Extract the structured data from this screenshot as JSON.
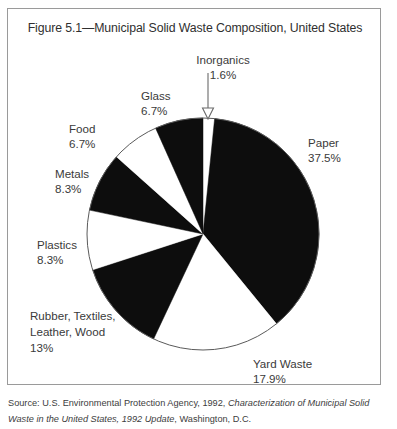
{
  "figure": {
    "title": "Figure 5.1—Municipal Solid Waste Composition, United States",
    "source_prefix": "Source: U.S. Environmental Protection Agency, 1992, ",
    "source_italic_1": "Characterization of Municipal Solid Waste in the United States, 1992 Update",
    "source_suffix": ", Washington, D.C."
  },
  "labels": {
    "inorganics_name": "Inorganics",
    "inorganics_pct": "1.6%",
    "glass_name": "Glass",
    "glass_pct": "6.7%",
    "paper_name": "Paper",
    "paper_pct": "37.5%",
    "food_name": "Food",
    "food_pct": "6.7%",
    "metals_name": "Metals",
    "metals_pct": "8.3%",
    "plastics_name": "Plastics",
    "plastics_pct": "8.3%",
    "rubber_line1": "Rubber, Textiles,",
    "rubber_line2": "Leather, Wood",
    "rubber_pct": "13%",
    "yardwaste_name": "Yard Waste",
    "yardwaste_pct": "17.9%"
  },
  "chart_data": {
    "type": "pie",
    "title": "Figure 5.1—Municipal Solid Waste Composition, United States",
    "xlabel": "",
    "ylabel": "",
    "legend": "none",
    "grid": false,
    "units": "percent of total municipal solid waste",
    "start_angle_deg": 0,
    "direction": "clockwise",
    "center": {
      "x": 202,
      "y": 233
    },
    "radius": 116,
    "categories": [
      "Inorganics",
      "Paper",
      "Yard Waste",
      "Rubber, Textiles, Leather, Wood",
      "Plastics",
      "Metals",
      "Food",
      "Glass"
    ],
    "values": [
      1.6,
      37.5,
      17.9,
      13,
      8.3,
      8.3,
      6.7,
      6.7
    ],
    "value_labels": [
      "1.6%",
      "37.5%",
      "17.9%",
      "13%",
      "8.3%",
      "8.3%",
      "6.7%",
      "6.7%"
    ],
    "slice_colors": [
      "#ffffff",
      "#0d0d0d",
      "#ffffff",
      "#0d0d0d",
      "#ffffff",
      "#0d0d0d",
      "#ffffff",
      "#0d0d0d"
    ],
    "outline_color": "#5a5a5a",
    "annotations": [
      {
        "text": "Inorganics 1.6%",
        "type": "leader-arrow",
        "points_to": "Inorganics"
      }
    ]
  },
  "colors": {
    "black_slice": "#0d0d0d",
    "white_slice": "#ffffff",
    "outline": "#5a5a5a",
    "text": "#3a3a3a",
    "border": "#9a9a9a"
  }
}
